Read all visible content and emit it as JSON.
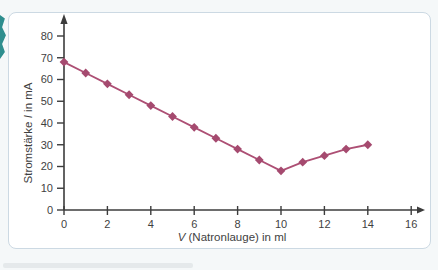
{
  "page": {
    "background": "#f5f8f9",
    "card_background": "#ffffff",
    "card_border_color": "#ccd9e3"
  },
  "decoration": {
    "teal_tab_color": "#2e8e8e",
    "caption_fragment_color": "#dfe4e6"
  },
  "chart_data": {
    "type": "line",
    "title": "",
    "xlabel": "V (Natronlauge) in ml",
    "ylabel": "Stromstärke I in mA",
    "xlabel_parts": [
      {
        "text": "V",
        "italic": true
      },
      {
        "text": " (Natronlauge) in ml",
        "italic": false
      }
    ],
    "ylabel_parts": [
      {
        "text": "Stromstärke ",
        "italic": false
      },
      {
        "text": "I",
        "italic": true
      },
      {
        "text": " in mA",
        "italic": false
      }
    ],
    "x": [
      0,
      1,
      2,
      3,
      4,
      5,
      6,
      7,
      8,
      9,
      10,
      11,
      12,
      13,
      14
    ],
    "series": [
      {
        "name": "Stromstärke",
        "values": [
          68,
          63,
          58,
          53,
          48,
          43,
          38,
          33,
          28,
          23,
          18,
          22,
          25,
          28,
          30
        ]
      }
    ],
    "x_ticks": [
      0,
      2,
      4,
      6,
      8,
      10,
      12,
      14,
      16
    ],
    "y_ticks": [
      0,
      10,
      20,
      30,
      40,
      50,
      60,
      70,
      80
    ],
    "xlim": [
      0,
      16
    ],
    "ylim": [
      0,
      85
    ],
    "grid": false,
    "legend": "none",
    "marker": "diamond",
    "line_color": "#ad4f74",
    "marker_color": "#a54a6f",
    "axis_color": "#3c3c3c",
    "tick_label_color": "#3f3f3f"
  }
}
